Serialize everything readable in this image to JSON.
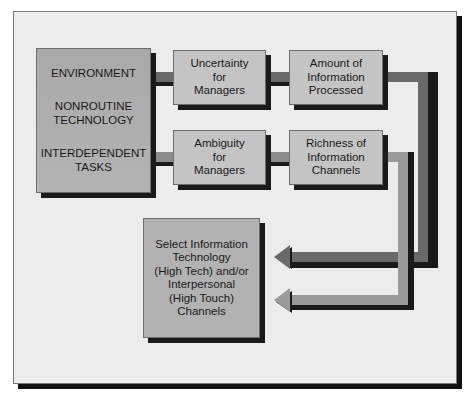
{
  "diagram": {
    "source_box": {
      "items": [
        {
          "lines": [
            "ENVIRONMENT"
          ]
        },
        {
          "lines": [
            "NONROUTINE",
            "TECHNOLOGY"
          ]
        },
        {
          "lines": [
            "INTERDEPENDENT",
            "TASKS"
          ]
        }
      ]
    },
    "row1": {
      "first": {
        "lines": [
          "Uncertainty",
          "for",
          "Managers"
        ]
      },
      "second": {
        "lines": [
          "Amount of",
          "Information",
          "Processed"
        ]
      }
    },
    "row2": {
      "first": {
        "lines": [
          "Ambiguity",
          "for",
          "Managers"
        ]
      },
      "second": {
        "lines": [
          "Richness of",
          "Information",
          "Channels"
        ]
      }
    },
    "target_box": {
      "lines": [
        "Select Information",
        "Technology",
        "(High Tech) and/or",
        "Interpersonal",
        "(High Touch)",
        "Channels"
      ]
    },
    "colors": {
      "frame_bg": "#ececec",
      "box_light": "#c4c4c4",
      "box_dark": "#adadad",
      "pipe_dark": "#6a6a6a",
      "pipe_light": "#9a9a9a",
      "shadow": "#1a1a1a"
    }
  }
}
